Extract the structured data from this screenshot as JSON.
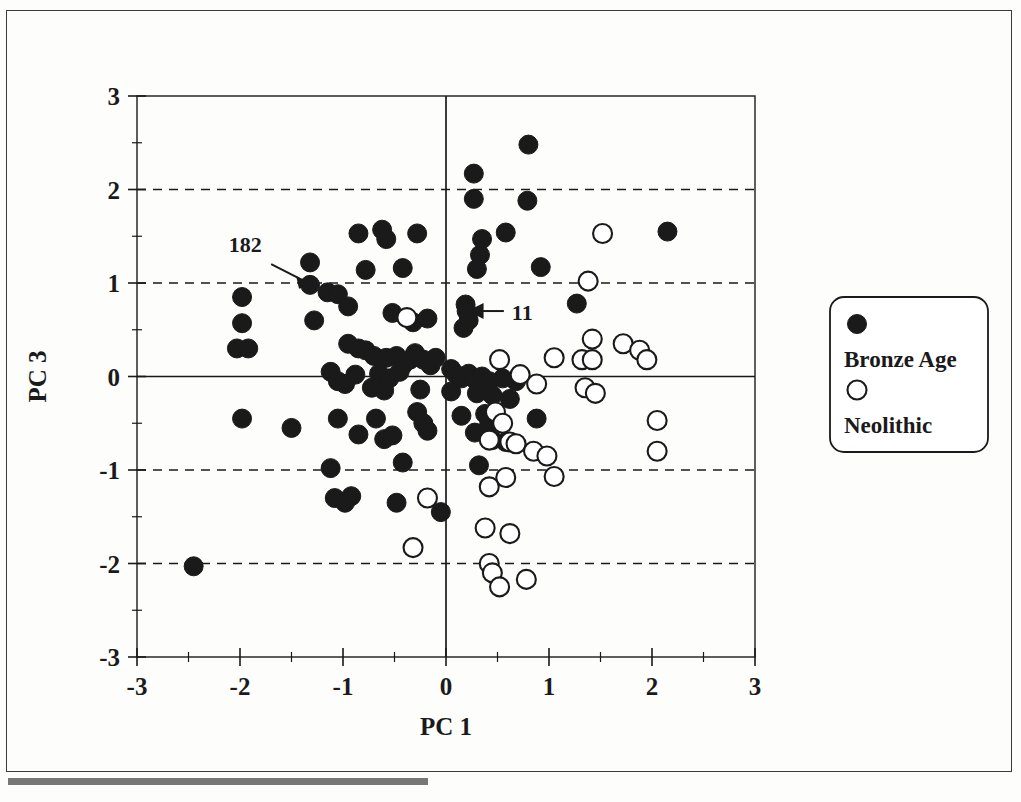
{
  "figure": {
    "kind": "scatterplot",
    "background": "#fdfdfc",
    "ink_color": "#1a1a1a"
  },
  "axes": {
    "x_title": "PC 1",
    "y_title": "PC 3",
    "x_ticklabels": [
      "-3",
      "-2",
      "-1",
      "0",
      "1",
      "2",
      "3"
    ],
    "y_ticklabels": [
      "3",
      "2",
      "1",
      "0",
      "-1",
      "-2",
      "-3"
    ]
  },
  "legend": {
    "items": [
      {
        "label": "Bronze Age",
        "marker": "filled-circle",
        "color": "#1a1a1a"
      },
      {
        "label": "Neolithic",
        "marker": "open-circle",
        "color": "#1a1a1a"
      }
    ]
  },
  "annotations": [
    {
      "text": "182",
      "label_x": -1.95,
      "label_y": 1.33,
      "point_x": -1.32,
      "point_y": 0.98
    },
    {
      "text": "11",
      "label_x": 0.62,
      "label_y": 0.7,
      "point_x": 0.19,
      "point_y": 0.7
    }
  ],
  "chart_data": {
    "type": "scatter",
    "title": "",
    "xlabel": "PC 1",
    "ylabel": "PC 3",
    "xlim": [
      -3,
      3
    ],
    "ylim": [
      -3,
      3
    ],
    "xticks": [
      -3,
      -2,
      -1,
      0,
      1,
      2,
      3
    ],
    "yticks": [
      -3,
      -2,
      -1,
      0,
      1,
      2,
      3
    ],
    "minor_tick_step": 0.5,
    "grid": "horizontal-dashed-at-2,1,-1,-2; solid-zero-lines",
    "legend_position": "right-outside",
    "series": [
      {
        "name": "Bronze Age",
        "marker": "filled-circle",
        "color": "#1a1a1a",
        "points": [
          [
            0.8,
            2.48
          ],
          [
            0.27,
            2.17
          ],
          [
            0.27,
            1.9
          ],
          [
            0.79,
            1.88
          ],
          [
            0.58,
            1.54
          ],
          [
            2.15,
            1.55
          ],
          [
            -0.85,
            1.53
          ],
          [
            -0.62,
            1.57
          ],
          [
            -0.58,
            1.47
          ],
          [
            -0.28,
            1.53
          ],
          [
            0.35,
            1.47
          ],
          [
            0.33,
            1.3
          ],
          [
            0.3,
            1.15
          ],
          [
            0.92,
            1.17
          ],
          [
            -1.32,
            1.22
          ],
          [
            -0.78,
            1.14
          ],
          [
            -0.42,
            1.16
          ],
          [
            -1.32,
            0.98
          ],
          [
            -1.15,
            0.9
          ],
          [
            -1.05,
            0.88
          ],
          [
            -0.95,
            0.75
          ],
          [
            -1.98,
            0.85
          ],
          [
            -1.98,
            0.57
          ],
          [
            -1.28,
            0.6
          ],
          [
            -0.52,
            0.68
          ],
          [
            -0.38,
            0.63
          ],
          [
            -0.32,
            0.58
          ],
          [
            -0.18,
            0.62
          ],
          [
            0.19,
            0.77
          ],
          [
            0.2,
            0.7
          ],
          [
            0.22,
            0.6
          ],
          [
            0.17,
            0.52
          ],
          [
            1.27,
            0.78
          ],
          [
            -2.03,
            0.3
          ],
          [
            -1.92,
            0.3
          ],
          [
            -0.95,
            0.35
          ],
          [
            -0.85,
            0.3
          ],
          [
            -0.78,
            0.28
          ],
          [
            -0.7,
            0.22
          ],
          [
            -0.58,
            0.2
          ],
          [
            -0.48,
            0.22
          ],
          [
            -0.42,
            0.12
          ],
          [
            -0.35,
            0.18
          ],
          [
            -0.3,
            0.25
          ],
          [
            -0.22,
            0.18
          ],
          [
            -0.15,
            0.12
          ],
          [
            -0.1,
            0.2
          ],
          [
            -1.12,
            0.05
          ],
          [
            -1.05,
            -0.05
          ],
          [
            -0.98,
            -0.08
          ],
          [
            -0.88,
            0.02
          ],
          [
            -0.65,
            0.03
          ],
          [
            -0.55,
            -0.02
          ],
          [
            -0.45,
            0.05
          ],
          [
            0.05,
            0.08
          ],
          [
            0.1,
            0.02
          ],
          [
            0.15,
            -0.02
          ],
          [
            0.22,
            0.03
          ],
          [
            0.28,
            -0.03
          ],
          [
            0.35,
            0.0
          ],
          [
            0.42,
            -0.05
          ],
          [
            0.55,
            -0.02
          ],
          [
            0.68,
            -0.05
          ],
          [
            -0.72,
            -0.12
          ],
          [
            -0.6,
            -0.15
          ],
          [
            -0.25,
            -0.14
          ],
          [
            0.05,
            -0.16
          ],
          [
            0.3,
            -0.18
          ],
          [
            0.45,
            -0.2
          ],
          [
            0.62,
            -0.24
          ],
          [
            -1.98,
            -0.45
          ],
          [
            -1.5,
            -0.55
          ],
          [
            -1.05,
            -0.45
          ],
          [
            -0.68,
            -0.45
          ],
          [
            -0.28,
            -0.38
          ],
          [
            -0.22,
            -0.5
          ],
          [
            0.15,
            -0.42
          ],
          [
            0.38,
            -0.4
          ],
          [
            0.42,
            -0.5
          ],
          [
            0.88,
            -0.45
          ],
          [
            -0.85,
            -0.62
          ],
          [
            -0.6,
            -0.67
          ],
          [
            -0.52,
            -0.63
          ],
          [
            -0.18,
            -0.58
          ],
          [
            0.28,
            -0.6
          ],
          [
            0.45,
            -0.68
          ],
          [
            0.58,
            -0.7
          ],
          [
            -1.12,
            -0.98
          ],
          [
            -0.42,
            -0.92
          ],
          [
            0.32,
            -0.95
          ],
          [
            -1.08,
            -1.3
          ],
          [
            -0.98,
            -1.35
          ],
          [
            -0.92,
            -1.28
          ],
          [
            -0.48,
            -1.35
          ],
          [
            -0.05,
            -1.45
          ],
          [
            -2.45,
            -2.03
          ]
        ]
      },
      {
        "name": "Neolithic",
        "marker": "open-circle",
        "color": "#1a1a1a",
        "points": [
          [
            1.52,
            1.53
          ],
          [
            1.38,
            1.02
          ],
          [
            -0.38,
            0.63
          ],
          [
            1.42,
            0.4
          ],
          [
            1.72,
            0.35
          ],
          [
            1.88,
            0.28
          ],
          [
            1.95,
            0.18
          ],
          [
            1.05,
            0.2
          ],
          [
            1.32,
            0.18
          ],
          [
            1.42,
            0.18
          ],
          [
            0.52,
            0.18
          ],
          [
            0.72,
            0.02
          ],
          [
            0.88,
            -0.08
          ],
          [
            1.35,
            -0.12
          ],
          [
            1.45,
            -0.18
          ],
          [
            0.48,
            -0.38
          ],
          [
            0.55,
            -0.5
          ],
          [
            2.05,
            -0.47
          ],
          [
            0.42,
            -0.68
          ],
          [
            0.62,
            -0.7
          ],
          [
            0.68,
            -0.72
          ],
          [
            0.85,
            -0.8
          ],
          [
            0.98,
            -0.85
          ],
          [
            2.05,
            -0.8
          ],
          [
            0.58,
            -1.08
          ],
          [
            1.05,
            -1.07
          ],
          [
            0.42,
            -1.18
          ],
          [
            -0.18,
            -1.3
          ],
          [
            -0.32,
            -1.83
          ],
          [
            0.38,
            -1.62
          ],
          [
            0.62,
            -1.68
          ],
          [
            0.42,
            -2.0
          ],
          [
            0.45,
            -2.1
          ],
          [
            0.52,
            -2.25
          ],
          [
            0.78,
            -2.17
          ]
        ]
      }
    ]
  }
}
